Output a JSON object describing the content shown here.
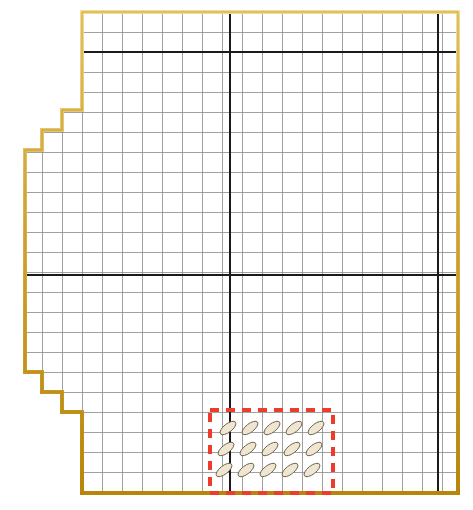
{
  "canvas": {
    "width": 473,
    "height": 510,
    "background": "#ffffff",
    "title": "Parcel Boundary Grid Map"
  },
  "colors": {
    "boundary_outer": "#b8860b",
    "boundary_fill": "#e3bc5a",
    "boundary_highlight": "#f2d98a",
    "grid_minor": "#8a8a8a",
    "grid_major": "#1a1a1a",
    "selection_dash": "#ef3b2c",
    "symbol_fill": "#efe6d2",
    "symbol_stroke": "#6b5f4a",
    "background": "#ffffff"
  },
  "grid": {
    "label": "Survey grid overlay",
    "cell_size": 20,
    "origin_x": 82,
    "origin_y": 12,
    "minor_line_width": 0.8,
    "major_line_width": 2.2,
    "columns": 19,
    "rows": 24,
    "major_vertical_x": [
      230,
      438
    ],
    "major_horizontal_y": [
      52,
      275
    ],
    "extent_left": 25,
    "extent_right": 458,
    "extent_top": 12,
    "extent_bottom": 493
  },
  "boundary": {
    "name": "parcel-outline",
    "style": "stepped-polygon",
    "stroke_width": 4,
    "points": [
      [
        82,
        12
      ],
      [
        458,
        12
      ],
      [
        458,
        493
      ],
      [
        82,
        493
      ],
      [
        82,
        412
      ],
      [
        62,
        412
      ],
      [
        62,
        392
      ],
      [
        42,
        392
      ],
      [
        42,
        372
      ],
      [
        25,
        372
      ],
      [
        25,
        150
      ],
      [
        42,
        150
      ],
      [
        42,
        130
      ],
      [
        62,
        130
      ],
      [
        62,
        110
      ],
      [
        82,
        110
      ]
    ]
  },
  "selection": {
    "name": "selected-area",
    "label": "Highlighted sample block",
    "style": "dashed",
    "dash_pattern": "9 7",
    "stroke_width": 4,
    "x": 210,
    "y": 410,
    "width": 123,
    "height": 83
  },
  "symbol_field": {
    "name": "hatch-symbol-array",
    "label": "Sample point symbols",
    "glyph": "tilted-ellipse",
    "rows": 3,
    "columns": 5,
    "rx": 9.5,
    "ry": 4.2,
    "rotation_deg": -38,
    "start_x": 228,
    "start_y": 428,
    "step_x": 22,
    "step_y": 21,
    "row_offset_x": -2,
    "count": 15
  },
  "legend": {
    "visible": false,
    "entries": []
  }
}
